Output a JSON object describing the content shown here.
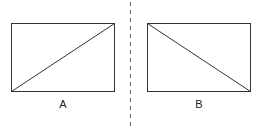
{
  "figures": [
    {
      "id": "A",
      "label": "A",
      "rect": {
        "x": 11,
        "y": 23,
        "w": 103,
        "h": 68
      },
      "diagonal": "bottom-left-to-top-right"
    },
    {
      "id": "B",
      "label": "B",
      "rect": {
        "x": 147,
        "y": 23,
        "w": 103,
        "h": 68
      },
      "diagonal": "top-left-to-bottom-right"
    }
  ],
  "divider": {
    "style": "dashed",
    "x": 130
  },
  "colors": {
    "stroke": "#333333",
    "divider": "#666666",
    "background": "#ffffff"
  }
}
